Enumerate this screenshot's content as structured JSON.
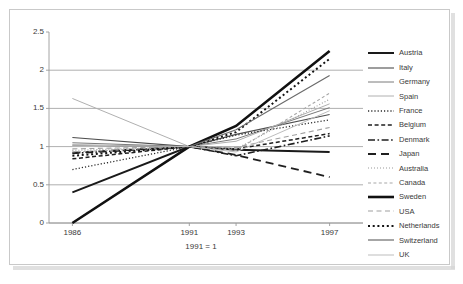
{
  "chart_data": {
    "type": "line",
    "title": "",
    "subtitle": "",
    "xlabel": "1991 = 1",
    "ylabel": "",
    "x": [
      1986,
      1991,
      1993,
      1997
    ],
    "xtick_labels": [
      "1986",
      "1991",
      "1993",
      "1997"
    ],
    "ytick_labels": [
      "0",
      "0.5",
      "1",
      "1.5",
      "2",
      "2.5"
    ],
    "ytick_values": [
      0,
      0.5,
      1,
      1.5,
      2,
      2.5
    ],
    "ylim": [
      0,
      2.5
    ],
    "xlim": [
      1985,
      1998
    ],
    "grid": "horizontal",
    "legend_position": "right",
    "annotation": "1991 = 1",
    "series": [
      {
        "name": "Austria",
        "values": [
          0.4,
          1.0,
          0.96,
          0.93
        ],
        "style": "solid",
        "width": 2.0,
        "color": "#1a1a1a"
      },
      {
        "name": "Italy",
        "values": [
          1.12,
          1.0,
          1.16,
          1.42
        ],
        "style": "solid",
        "width": 1.1,
        "color": "#4d4d4d"
      },
      {
        "name": "Germany",
        "values": [
          1.05,
          1.0,
          1.1,
          1.51
        ],
        "style": "solid",
        "width": 1.0,
        "color": "#7a7a7a"
      },
      {
        "name": "Spain",
        "values": [
          1.63,
          1.0,
          1.07,
          1.56
        ],
        "style": "solid",
        "width": 1.0,
        "color": "#b0b0b0"
      },
      {
        "name": "France",
        "values": [
          0.7,
          1.0,
          1.15,
          1.35
        ],
        "style": "dotted",
        "width": 1.3,
        "color": "#2b2b2b"
      },
      {
        "name": "Belgium",
        "values": [
          0.84,
          1.0,
          0.97,
          1.17
        ],
        "style": "dashed",
        "width": 1.5,
        "color": "#1f1f1f"
      },
      {
        "name": "Denmark",
        "values": [
          0.91,
          1.0,
          0.88,
          1.14
        ],
        "style": "dash-dot",
        "width": 1.6,
        "color": "#1f1f1f"
      },
      {
        "name": "Japan",
        "values": [
          0.92,
          1.0,
          0.89,
          0.6
        ],
        "style": "long-dash",
        "width": 1.8,
        "color": "#1f1f1f"
      },
      {
        "name": "Australia",
        "values": [
          0.95,
          1.0,
          0.97,
          1.62
        ],
        "style": "fine-dotted",
        "width": 1.1,
        "color": "#9a9a9a"
      },
      {
        "name": "Canada",
        "values": [
          0.93,
          1.0,
          0.95,
          1.7
        ],
        "style": "short-dash",
        "width": 1.1,
        "color": "#a8a8a8"
      },
      {
        "name": "Sweden",
        "values": [
          0.0,
          1.0,
          1.27,
          2.25
        ],
        "style": "solid",
        "width": 2.6,
        "color": "#111111"
      },
      {
        "name": "USA",
        "values": [
          0.97,
          1.0,
          0.99,
          1.25
        ],
        "style": "loose-dash",
        "width": 1.1,
        "color": "#a0a0a0"
      },
      {
        "name": "Netherlands",
        "values": [
          0.88,
          1.0,
          1.19,
          2.15
        ],
        "style": "thick-dotted",
        "width": 2.0,
        "color": "#141414"
      },
      {
        "name": "Switzerland",
        "values": [
          1.02,
          1.0,
          1.22,
          1.93
        ],
        "style": "solid",
        "width": 1.2,
        "color": "#6b6b6b"
      },
      {
        "name": "UK",
        "values": [
          1.02,
          1.0,
          0.93,
          1.47
        ],
        "style": "solid",
        "width": 1.0,
        "color": "#bdbdbd"
      }
    ]
  },
  "legend": {
    "items": [
      {
        "label": "Austria"
      },
      {
        "label": "Italy"
      },
      {
        "label": "Germany"
      },
      {
        "label": "Spain"
      },
      {
        "label": "France"
      },
      {
        "label": "Belgium"
      },
      {
        "label": "Denmark"
      },
      {
        "label": "Japan"
      },
      {
        "label": "Australia"
      },
      {
        "label": "Canada"
      },
      {
        "label": "Sweden"
      },
      {
        "label": "USA"
      },
      {
        "label": "Netherlands"
      },
      {
        "label": "Switzerland"
      },
      {
        "label": "UK"
      }
    ]
  },
  "colors": {
    "axis": "#9a9a9a",
    "grid": "#9a9a9a",
    "text": "#3a3a3a",
    "border": "#c9c9c9",
    "background": "#ffffff"
  }
}
